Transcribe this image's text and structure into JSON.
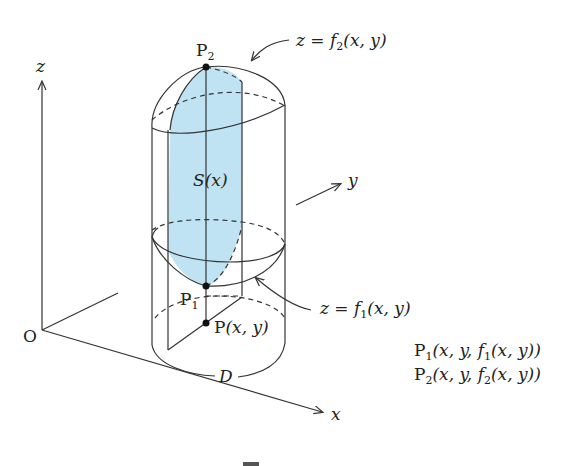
{
  "figure": {
    "type": "3d-volume-diagram",
    "colors": {
      "shade": "#bfe3f2",
      "line": "#333333",
      "point": "#111111"
    },
    "axes": {
      "origin_label": "O",
      "x_label": "x",
      "y_label": "y",
      "z_label": "z"
    },
    "points": {
      "p2": {
        "base": "P",
        "sub": "2"
      },
      "p1": {
        "base": "P",
        "sub": "1"
      },
      "p": {
        "base": "P",
        "args": "(x, y)"
      }
    },
    "surfaces": {
      "upper": {
        "lhs": "z",
        "eq": " = ",
        "f": "f",
        "sub": "2",
        "args": "(x, y)"
      },
      "lower": {
        "lhs": "z",
        "eq": " = ",
        "f": "f",
        "sub": "1",
        "args": "(x, y)"
      }
    },
    "region_label": "D",
    "section_label": {
      "S": "S",
      "args": "(x)"
    },
    "coords": {
      "p1": {
        "base": "P",
        "sub": "1",
        "args_a": "(x, y, ",
        "f": "f",
        "fsub": "1",
        "args_b": "(x, y))"
      },
      "p2": {
        "base": "P",
        "sub": "2",
        "args_a": "(x, y, ",
        "f": "f",
        "fsub": "2",
        "args_b": "(x, y))"
      }
    }
  }
}
